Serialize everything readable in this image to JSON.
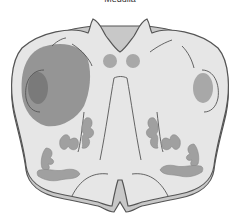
{
  "diagram": {
    "title": "Medulla",
    "structure": "medulla cross-section",
    "colors": {
      "tissue": "#e6e6e6",
      "outline": "#555555",
      "lesion": "#8c8c8c",
      "nuclei": "#a8a8a8",
      "base_edge": "#c8c8c8"
    }
  }
}
